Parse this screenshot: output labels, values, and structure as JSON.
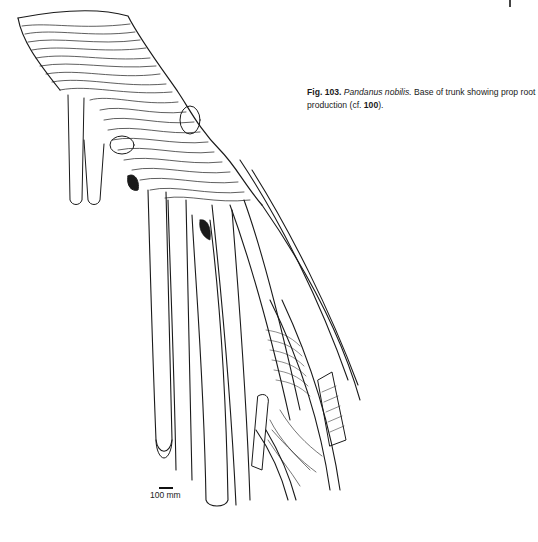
{
  "figure": {
    "label": "Fig. 103.",
    "species": "Pandanus nobilis.",
    "description": " Base of trunk showing prop root production (cf. ",
    "reference": "100",
    "closing": ")."
  },
  "scale_bar": {
    "label": "100 mm"
  },
  "illustration": {
    "subject": "pandanus-trunk-prop-roots",
    "ink_color": "#1a1a1a",
    "background_color": "#ffffff"
  }
}
